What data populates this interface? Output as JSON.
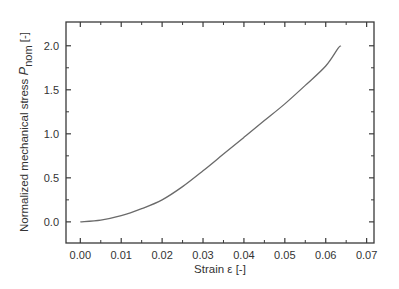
{
  "chart_data": {
    "type": "line",
    "title": "",
    "xlabel": "Strain ε [-]",
    "ylabel": "Normalized mechanical stress P_nom [-]",
    "ylabel_parts": {
      "main": "Normalized mechanical stress ",
      "symbol": "P",
      "subscript": "nom",
      "unit": " [-]"
    },
    "xlim": [
      -0.0035,
      0.0718
    ],
    "ylim": [
      -0.24,
      2.27
    ],
    "xticks": [
      0.0,
      0.01,
      0.02,
      0.03,
      0.04,
      0.05,
      0.06,
      0.07
    ],
    "xtick_labels": [
      "0.00",
      "0.01",
      "0.02",
      "0.03",
      "0.04",
      "0.05",
      "0.06",
      "0.07"
    ],
    "yticks": [
      0.0,
      0.5,
      1.0,
      1.5,
      2.0
    ],
    "ytick_labels": [
      "0.0",
      "0.5",
      "1.0",
      "1.5",
      "2.0"
    ],
    "grid": false,
    "legend": null,
    "series": [
      {
        "name": "P_nom",
        "color": "#6a6a6a",
        "x": [
          0.0,
          0.005,
          0.01,
          0.015,
          0.02,
          0.025,
          0.03,
          0.035,
          0.04,
          0.045,
          0.05,
          0.055,
          0.06,
          0.063,
          0.0637
        ],
        "y": [
          0.0,
          0.02,
          0.07,
          0.15,
          0.25,
          0.4,
          0.58,
          0.77,
          0.96,
          1.15,
          1.34,
          1.55,
          1.77,
          1.97,
          2.0
        ]
      }
    ]
  },
  "colors": {
    "axis": "#3a3a3a",
    "curve": "#6a6a6a",
    "text": "#333333"
  }
}
